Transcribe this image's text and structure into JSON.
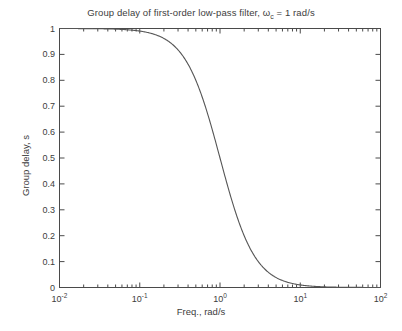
{
  "figure": {
    "background_color": "#ffffff",
    "axes_color": "#4a4a4a",
    "text_color": "#3d3d3d",
    "line_color": "#555555"
  },
  "title": {
    "text_before": "Group delay of first-order low-pass filter, ω",
    "subscript": "c",
    "text_after": " = 1 rad/s",
    "full": "Group delay of first-order low-pass filter, ωc = 1 rad/s"
  },
  "axis_labels": {
    "x": "Freq., rad/s",
    "y": "Group delay, s"
  },
  "xticks": [
    {
      "mantissa": "10",
      "exponent": "-2",
      "value": 0.01
    },
    {
      "mantissa": "10",
      "exponent": "-1",
      "value": 0.1
    },
    {
      "mantissa": "10",
      "exponent": "0",
      "value": 1
    },
    {
      "mantissa": "10",
      "exponent": "1",
      "value": 10
    },
    {
      "mantissa": "10",
      "exponent": "2",
      "value": 100
    }
  ],
  "yticks": [
    "0",
    "0.1",
    "0.2",
    "0.3",
    "0.4",
    "0.5",
    "0.6",
    "0.7",
    "0.8",
    "0.9",
    "1"
  ],
  "chart_data": {
    "type": "line",
    "title": "Group delay of first-order low-pass filter, ωc = 1 rad/s",
    "xlabel": "Freq., rad/s",
    "ylabel": "Group delay, s",
    "xscale": "log",
    "yscale": "linear",
    "xlim": [
      0.01,
      100
    ],
    "ylim": [
      0,
      1
    ],
    "grid": false,
    "legend": false,
    "formula": "tau(w) = 1 / (1 + w^2), wc = 1 rad/s",
    "series": [
      {
        "name": "group delay",
        "color": "#555555",
        "x": [
          0.01,
          0.0126,
          0.0158,
          0.02,
          0.0251,
          0.0316,
          0.0398,
          0.0501,
          0.0631,
          0.0794,
          0.1,
          0.126,
          0.158,
          0.2,
          0.251,
          0.316,
          0.398,
          0.501,
          0.631,
          0.794,
          1.0,
          1.26,
          1.58,
          2.0,
          2.51,
          3.16,
          3.98,
          5.01,
          6.31,
          7.94,
          10.0,
          12.6,
          15.8,
          20.0,
          25.1,
          31.6,
          39.8,
          50.1,
          63.1,
          79.4,
          100.0
        ],
        "y": [
          1.0,
          1.0,
          1.0,
          1.0,
          0.999,
          0.999,
          0.998,
          0.997,
          0.996,
          0.994,
          0.99,
          0.984,
          0.975,
          0.962,
          0.941,
          0.909,
          0.863,
          0.799,
          0.715,
          0.613,
          0.5,
          0.387,
          0.285,
          0.2,
          0.137,
          0.091,
          0.0594,
          0.0383,
          0.0245,
          0.0156,
          0.0099,
          0.00627,
          0.00397,
          0.00249,
          0.00158,
          0.001,
          0.00063,
          0.0004,
          0.00025,
          0.00016,
          0.0001
        ]
      }
    ],
    "annotations": [
      {
        "text": "cutoff at omega = 1 rad/s gives group delay 0.5 s",
        "x": 1,
        "y": 0.5
      }
    ]
  }
}
